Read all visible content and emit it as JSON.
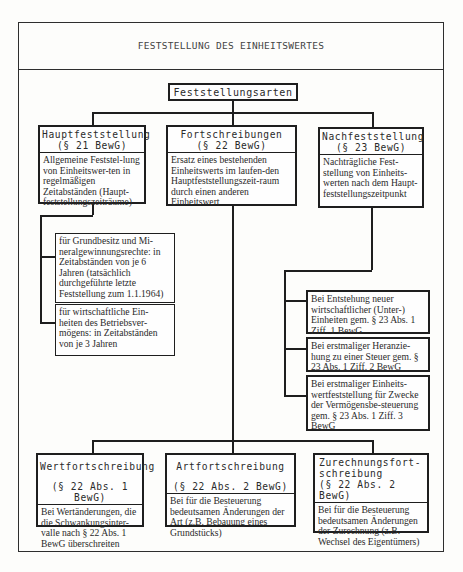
{
  "header": {
    "title": "FESTSTELLUNG DES EINHEITSWERTES"
  },
  "root": {
    "label": "Feststellungsarten"
  },
  "level1": [
    {
      "title": "Hauptfeststellung",
      "section": "(§ 21 BewG)",
      "description": "Allgemeine Feststel-lung von Einheitswer-ten in regelmäßigen Zeitabständen (Haupt-feststellungszeiträume)"
    },
    {
      "title": "Fortschreibungen",
      "section": "(§ 22 BewG)",
      "description": "Ersatz eines bestehenden Einheitswerts im laufen-den Hauptfeststellungszeit-raum durch einen anderen Einheitswert"
    },
    {
      "title": "Nachfeststellung",
      "section": "(§ 23 BewG)",
      "description": "Nachträgliche Fest-stellung von Einheits-werten nach dem Haupt-feststellungszeitpunkt"
    }
  ],
  "haupt_details": [
    {
      "text": "für Grundbesitz und Mi-neralgewinnungsrechte: in Zeitabständen von je 6 Jahren (tatsächlich durchgeführte letzte Feststellung zum 1.1.1964)"
    },
    {
      "text": "für wirtschaftliche Ein-heiten des Betriebsver-mögens: in Zeitabständen von je 3 Jahren"
    }
  ],
  "nach_details": [
    {
      "text": "Bei Entstehung neuer wirtschaftlicher (Unter-) Einheiten gem. § 23 Abs. 1 Ziff. 1 BewG"
    },
    {
      "text": "Bei erstmaliger Heranzie-hung zu einer Steuer gem. § 23 Abs. 1 Ziff. 2 BewG"
    },
    {
      "text": "Bei erstmaliger Einheits-wertfeststellung für Zwecke der Vermögensbe-steuerung gem. § 23 Abs. 1 Ziff. 3 BewG"
    }
  ],
  "fort_types": [
    {
      "title": "Wertfortschreibung",
      "section": "(§ 22 Abs. 1 BewG)",
      "description": "Bei Wertänderungen, die die Schwankungsinter-valle nach § 22 Abs. 1 BewG überschreiten"
    },
    {
      "title": "Artfortschreibung",
      "section": "(§ 22 Abs. 2 BewG)",
      "description": "Bei für die Besteuerung bedeutsamen Änderungen der Art (z.B. Bebauung eines Grundstücks)"
    },
    {
      "title": "Zurechnungsfort-schreibung",
      "section": "(§ 22 Abs. 2 BewG)",
      "description": "Bei für die Besteuerung bedeutsamen Änderungen der Zurechnung (z.B. Wechsel des Eigentümers)"
    }
  ]
}
